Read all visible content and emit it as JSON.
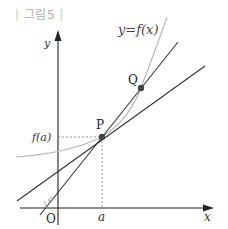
{
  "figure": {
    "label": "그림5",
    "label_open": "|",
    "label_close": "|"
  },
  "axes": {
    "x_label": "x",
    "y_label": "y",
    "origin_label": "O"
  },
  "curve": {
    "label": "y=f(x)",
    "color": "#b8b8b8"
  },
  "points": {
    "P": {
      "label": "P",
      "x_label": "a",
      "y_label": "f(a)"
    },
    "Q": {
      "label": "Q"
    }
  },
  "angle": {
    "label": "θ"
  },
  "colors": {
    "axis": "#222222",
    "line": "#333333",
    "point": "#444444",
    "dashed": "#888888",
    "figure_label": "#b0b0b0"
  }
}
